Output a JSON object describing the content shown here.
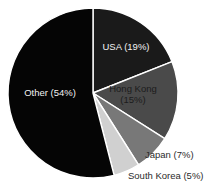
{
  "chart_data": {
    "type": "pie",
    "title": "",
    "subtitle": "",
    "xlabel": "",
    "ylabel": "",
    "legend": "none",
    "grid": false,
    "start_angle_deg": 0,
    "direction": "clockwise",
    "center": {
      "x": 93,
      "y": 93
    },
    "radius": 85,
    "categories": [
      "USA",
      "Hong Kong",
      "Japan",
      "South Korea",
      "Other"
    ],
    "values": [
      19,
      15,
      7,
      5,
      54
    ],
    "value_unit": "percent",
    "total": 100,
    "slices": [
      {
        "name": "USA",
        "value": 19,
        "label": "USA (19%)",
        "color": "#1a1a1a",
        "label_placement": "inside",
        "label_style": "light",
        "label_x": 126,
        "label_y": 47,
        "label_anchor": "middle",
        "lines": [
          "USA (19%)"
        ]
      },
      {
        "name": "Hong Kong",
        "value": 15,
        "label": "Hong Kong (15%)",
        "color": "#4a4a4a",
        "label_placement": "inside",
        "label_style": "dark",
        "label_x": 133,
        "label_y": 94,
        "label_anchor": "middle",
        "lines": [
          "Hong Kong",
          "(15%)"
        ]
      },
      {
        "name": "Japan",
        "value": 7,
        "label": "Japan (7%)",
        "color": "#787878",
        "label_placement": "outside",
        "label_style": "outside",
        "label_x": 145,
        "label_y": 155,
        "label_anchor": "start",
        "lines": [
          "Japan (7%)"
        ]
      },
      {
        "name": "South Korea",
        "value": 5,
        "label": "South Korea (5%)",
        "color": "#d0d0d0",
        "label_placement": "outside",
        "label_style": "outside",
        "label_x": 128,
        "label_y": 176,
        "label_anchor": "start",
        "lines": [
          "South Korea (5%)"
        ]
      },
      {
        "name": "Other",
        "value": 54,
        "label": "Other (54%)",
        "color": "#050505",
        "label_placement": "inside",
        "label_style": "light",
        "label_x": 50,
        "label_y": 93,
        "label_anchor": "middle",
        "lines": [
          "Other (54%)"
        ]
      }
    ],
    "colors": {
      "usa": "#1a1a1a",
      "hong_kong": "#4a4a4a",
      "japan": "#787878",
      "south_korea": "#d0d0d0",
      "other": "#050505",
      "separator": "#ffffff",
      "background": "#ffffff",
      "label_light": "#f2f2f2",
      "label_dark": "#1c1c1c",
      "label_outside": "#2b2b2b"
    }
  }
}
